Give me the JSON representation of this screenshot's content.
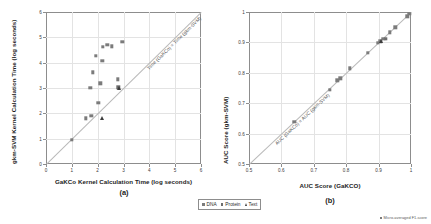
{
  "figure": {
    "colors": {
      "dna": "#7b7b7b",
      "protein": "#6d6d6d",
      "text": "#3c3c3c",
      "identity_line": "#b9b9b9",
      "grid": "#e3e3e3",
      "axis": "#8d8d8d"
    },
    "legend": {
      "items": [
        {
          "label": "DNA",
          "marker": "square",
          "color": "#7b7b7b"
        },
        {
          "label": "Protein",
          "marker": "square",
          "color": "#6d6d6d"
        },
        {
          "label": "Text",
          "marker": "triangle",
          "color": "#3c3c3c"
        }
      ]
    },
    "footnote": {
      "text": "Micro-averaged F1-score",
      "marker": "square",
      "color": "#7b7b7b"
    }
  },
  "chart_data": [
    {
      "id": "panel-a",
      "type": "scatter",
      "panel_label": "(a)",
      "title": "",
      "xlabel": "GaKCo Kernel Calculation Time (log seconds)",
      "ylabel": "gkm-SVM Kernel Calculation Time (log seconds)",
      "xlim": [
        0,
        6
      ],
      "ylim": [
        0,
        6
      ],
      "xticks": [
        0,
        1,
        2,
        3,
        4,
        5,
        6
      ],
      "xticklabels": [
        "0",
        "1",
        "2",
        "3",
        "4",
        "5",
        "6"
      ],
      "yticks": [
        0,
        1,
        2,
        3,
        4,
        5,
        6
      ],
      "yticklabels": [
        "0",
        "1",
        "2",
        "3",
        "4",
        "5",
        "6"
      ],
      "grid": true,
      "legend_position": "below-figure",
      "annotations": [
        {
          "text": "Time (GaKCo) = Time (gkm-SVM)",
          "kind": "identity-line-label",
          "angle_deg": -45
        }
      ],
      "reference_line": {
        "type": "identity",
        "from": [
          0,
          0
        ],
        "to": [
          6,
          6
        ]
      },
      "series": [
        {
          "name": "DNA",
          "marker": "square",
          "color": "#7b7b7b",
          "points": [
            [
              1.0,
              0.95
            ],
            [
              1.55,
              1.8
            ],
            [
              1.75,
              1.9
            ],
            [
              1.72,
              3.0
            ],
            [
              1.82,
              3.62
            ],
            [
              1.92,
              4.28
            ],
            [
              2.02,
              2.42
            ],
            [
              2.1,
              3.18
            ],
            [
              2.18,
              4.08
            ],
            [
              2.2,
              4.62
            ],
            [
              2.38,
              4.7
            ],
            [
              2.55,
              4.65
            ],
            [
              2.78,
              3.35
            ],
            [
              2.95,
              4.82
            ]
          ]
        },
        {
          "name": "Protein",
          "marker": "square",
          "color": "#6d6d6d",
          "points": [
            [
              2.8,
              3.02
            ]
          ]
        },
        {
          "name": "Text",
          "marker": "triangle",
          "color": "#3c3c3c",
          "points": [
            [
              2.18,
              1.82
            ],
            [
              2.82,
              3.0
            ]
          ]
        }
      ]
    },
    {
      "id": "panel-b",
      "type": "scatter",
      "panel_label": "(b)",
      "title": "",
      "xlabel": "AUC Score (GaKCO)",
      "ylabel": "AUC Score (gkm-SVM)",
      "xlim": [
        0.5,
        1.0
      ],
      "ylim": [
        0.5,
        1.0
      ],
      "xticks": [
        0.5,
        0.6,
        0.7,
        0.8,
        0.9,
        1.0
      ],
      "xticklabels": [
        "0.5",
        "0.6",
        "0.7",
        "0.8",
        "0.9",
        "1"
      ],
      "yticks": [
        0.5,
        0.6,
        0.7,
        0.8,
        0.9,
        1.0
      ],
      "yticklabels": [
        "0.5",
        "0.6",
        "0.7",
        "0.8",
        "0.9",
        "1"
      ],
      "grid": true,
      "legend_position": "below-figure",
      "annotations": [
        {
          "text": "AUC (GaKCo) = AUC (gkm-SVM)",
          "kind": "identity-line-label",
          "angle_deg": -45
        }
      ],
      "reference_line": {
        "type": "identity",
        "from": [
          0.5,
          0.5
        ],
        "to": [
          1.0,
          1.0
        ]
      },
      "series": [
        {
          "name": "DNA",
          "marker": "square",
          "color": "#7b7b7b",
          "points": [
            [
              0.64,
              0.638
            ],
            [
              0.75,
              0.745
            ],
            [
              0.772,
              0.775
            ],
            [
              0.782,
              0.782
            ],
            [
              0.812,
              0.815
            ],
            [
              0.866,
              0.866
            ],
            [
              0.898,
              0.898
            ],
            [
              0.905,
              0.903
            ],
            [
              0.914,
              0.912
            ],
            [
              0.935,
              0.933
            ],
            [
              0.952,
              0.95
            ],
            [
              0.988,
              0.986
            ],
            [
              0.995,
              0.995
            ]
          ]
        },
        {
          "name": "Protein",
          "marker": "square",
          "color": "#6d6d6d",
          "points": [
            [
              0.922,
              0.911
            ]
          ]
        },
        {
          "name": "Text",
          "marker": "triangle",
          "color": "#3c3c3c",
          "points": [
            [
              0.908,
              0.906
            ]
          ]
        }
      ]
    }
  ]
}
